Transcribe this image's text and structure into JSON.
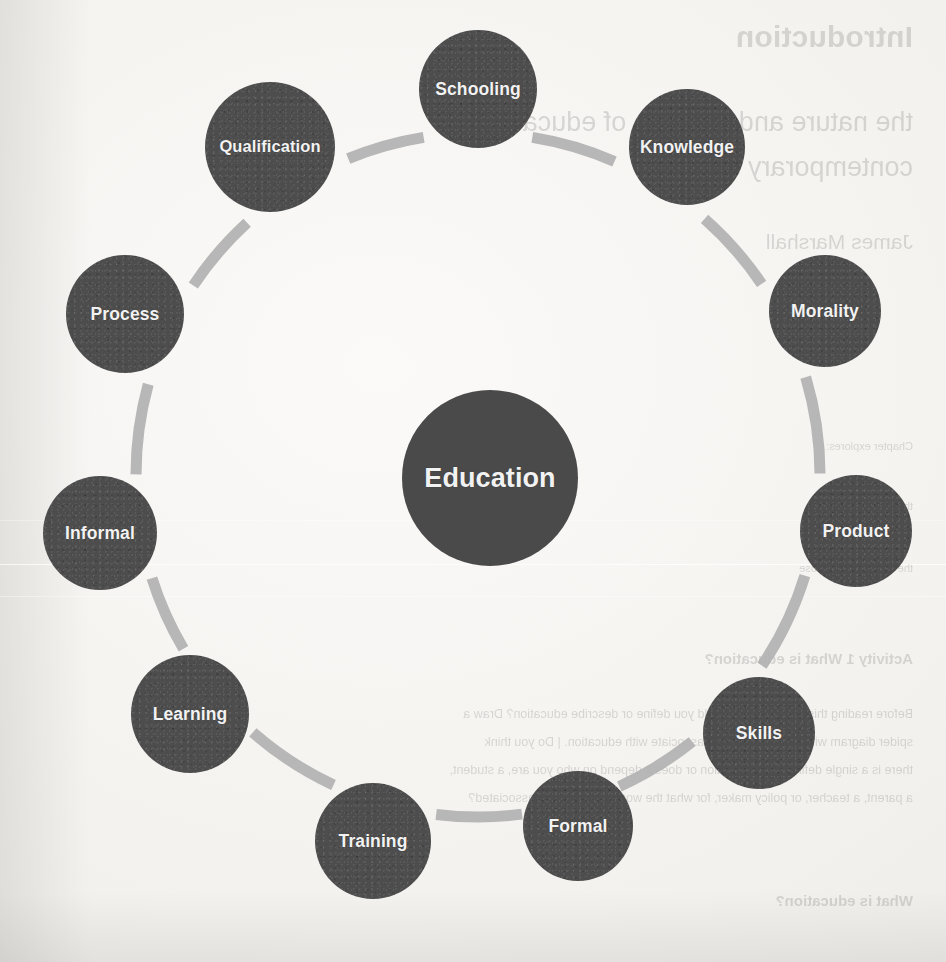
{
  "diagram": {
    "type": "radial-concept-map",
    "center": {
      "label": "Education",
      "cx": 490,
      "cy": 478,
      "r": 88
    },
    "ring": {
      "cx": 478,
      "cy": 475,
      "radius": 342,
      "arc_color": "#b3b3b3",
      "arc_width": 11
    },
    "node_color": "#4d4d4d",
    "label_color": "#f2f2f2",
    "paper_color": "#f4f2ef",
    "nodes": [
      {
        "label": "Schooling",
        "cx": 478,
        "cy": 89,
        "r": 59,
        "angle_deg": -90
      },
      {
        "label": "Knowledge",
        "cx": 687,
        "cy": 147,
        "r": 58,
        "angle_deg": -57
      },
      {
        "label": "Morality",
        "cx": 825,
        "cy": 311,
        "r": 56,
        "angle_deg": -24
      },
      {
        "label": "Product",
        "cx": 856,
        "cy": 531,
        "r": 56,
        "angle_deg": 9
      },
      {
        "label": "Skills",
        "cx": 759,
        "cy": 733,
        "r": 56,
        "angle_deg": 42
      },
      {
        "label": "Formal",
        "cx": 578,
        "cy": 826,
        "r": 55,
        "angle_deg": 66
      },
      {
        "label": "Training",
        "cx": 373,
        "cy": 841,
        "r": 58,
        "angle_deg": 100
      },
      {
        "label": "Learning",
        "cx": 190,
        "cy": 714,
        "r": 59,
        "angle_deg": 133
      },
      {
        "label": "Informal",
        "cx": 100,
        "cy": 533,
        "r": 57,
        "angle_deg": 162
      },
      {
        "label": "Process",
        "cx": 125,
        "cy": 314,
        "r": 59,
        "angle_deg": 198
      },
      {
        "label": "Qualification",
        "cx": 270,
        "cy": 147,
        "r": 65,
        "angle_deg": 232
      }
    ]
  },
  "bleed_through": {
    "note": "faint mirrored text showing through from the reverse side of the scanned page",
    "lines": [
      {
        "text": "Introduction",
        "style": "bl-h1",
        "x": 33,
        "y": 20
      },
      {
        "text": "the nature and purpose of education in",
        "style": "bl-h2",
        "x": 33,
        "y": 107
      },
      {
        "text": "contemporary society",
        "style": "bl-h2",
        "x": 33,
        "y": 152
      },
      {
        "text": "James Marshall",
        "style": "bl-h3",
        "x": 33,
        "y": 230
      },
      {
        "text": "Chapter explores:",
        "style": "bl-sm",
        "x": 33,
        "y": 440
      },
      {
        "text": "the nature",
        "style": "bl-sm",
        "x": 33,
        "y": 500
      },
      {
        "text": "the nature and purpose",
        "style": "bl-sm",
        "x": 33,
        "y": 562
      },
      {
        "text": "Activity 1   What is education?",
        "style": "bl-h4",
        "x": 33,
        "y": 650
      },
      {
        "text": "Before reading this chapter, how would you define or describe education? Draw a",
        "style": "bl-bd",
        "x": 33,
        "y": 707
      },
      {
        "text": "spider diagram with all the words you associate with education. | Do you think",
        "style": "bl-bd",
        "x": 33,
        "y": 735
      },
      {
        "text": "there is a single definition of education or does it depend on who you are, a student,",
        "style": "bl-bd",
        "x": 33,
        "y": 763
      },
      {
        "text": "a parent, a teacher, or policy maker, for what the words education is associated?",
        "style": "bl-bd",
        "x": 33,
        "y": 791
      },
      {
        "text": "What is education?",
        "style": "bl-h4",
        "x": 33,
        "y": 892
      }
    ]
  }
}
